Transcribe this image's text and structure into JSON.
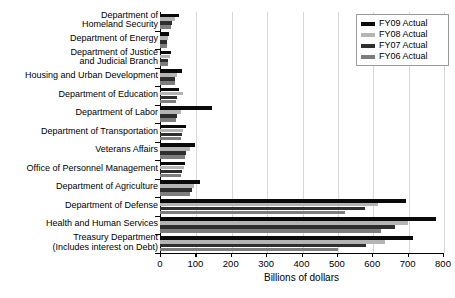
{
  "chart_data": {
    "type": "bar",
    "orientation": "horizontal",
    "title": "",
    "xlabel": "Billions of dollars",
    "ylabel": "",
    "xlim": [
      0,
      800
    ],
    "xticks": [
      0,
      100,
      200,
      300,
      400,
      500,
      600,
      700,
      800
    ],
    "grid": true,
    "legend_position": "top-right",
    "categories": [
      "Department of\nHomeland Security",
      "Department of Energy",
      "Department of Justice\nand Judicial Branch",
      "Housing and Urban Development",
      "Department of Education",
      "Department of Labor",
      "Department of Transportation",
      "Veterans Affairs",
      "Office of Personnel Management",
      "Department of Agriculture",
      "Department of Defense",
      "Health and Human Services",
      "Treasury Department\n(Includes interest on Debt)"
    ],
    "series": [
      {
        "name": "FY09 Actual",
        "color": "#0a0a0a",
        "values": [
          55,
          26,
          32,
          61,
          53,
          147,
          73,
          98,
          70,
          114,
          696,
          780,
          714
        ]
      },
      {
        "name": "FY08 Actual",
        "color": "#b4b4b4",
        "values": [
          41,
          22,
          27,
          49,
          66,
          59,
          65,
          85,
          67,
          95,
          616,
          701,
          636
        ]
      },
      {
        "name": "FY07 Actual",
        "color": "#2e2e2e",
        "values": [
          33,
          20,
          23,
          43,
          48,
          49,
          62,
          73,
          63,
          90,
          579,
          663,
          582
        ]
      },
      {
        "name": "FY06 Actual",
        "color": "#7d7d7d",
        "values": [
          30,
          19,
          22,
          41,
          46,
          45,
          60,
          70,
          60,
          86,
          522,
          625,
          504
        ]
      }
    ]
  },
  "legend": {
    "items": [
      {
        "label": "FY09 Actual",
        "key": "fy09"
      },
      {
        "label": "FY08 Actual",
        "key": "fy08"
      },
      {
        "label": "FY07 Actual",
        "key": "fy07"
      },
      {
        "label": "FY06 Actual",
        "key": "fy06"
      }
    ]
  },
  "axis": {
    "tick_labels": [
      "0",
      "100",
      "200",
      "300",
      "400",
      "500",
      "600",
      "700",
      "800"
    ],
    "x_axis_title": "Billions of dollars"
  }
}
